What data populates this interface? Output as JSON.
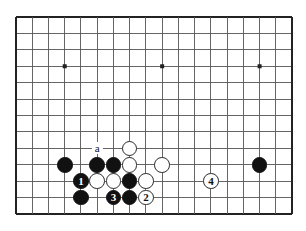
{
  "figure": {
    "kind": "go-board-diagram",
    "title": "",
    "board": {
      "columns": 18,
      "rows": 13,
      "left": 16,
      "top": 17,
      "cell_x": 16.24,
      "cell_y": 16.42,
      "line_color": "#555555",
      "edge_color": "#222222",
      "background_color": "#ffffff",
      "star_points": [
        {
          "col": 3,
          "row": 3
        },
        {
          "col": 9,
          "row": 3
        },
        {
          "col": 15,
          "row": 3
        }
      ]
    },
    "colors": {
      "black_stone": "#111111",
      "white_stone": "#ffffff",
      "white_stone_border": "#2a2a2a",
      "black_label_text": "#ffffff",
      "white_label_text": "#111111"
    },
    "stones": [
      {
        "id": "b-left-outer",
        "color": "black",
        "col": 3,
        "row": 9,
        "label": ""
      },
      {
        "id": "b-upper-left",
        "color": "black",
        "col": 5,
        "row": 9,
        "label": ""
      },
      {
        "id": "b-upper-mid",
        "color": "black",
        "col": 6,
        "row": 9,
        "label": ""
      },
      {
        "id": "w-top",
        "color": "white",
        "col": 7,
        "row": 8,
        "label": ""
      },
      {
        "id": "w-upper-mid",
        "color": "white",
        "col": 7,
        "row": 9,
        "label": ""
      },
      {
        "id": "w-right-wing",
        "color": "white",
        "col": 9,
        "row": 9,
        "label": ""
      },
      {
        "id": "b-move-1",
        "color": "black",
        "col": 4,
        "row": 10,
        "label": "1"
      },
      {
        "id": "w-mid-left",
        "color": "white",
        "col": 5,
        "row": 10,
        "label": ""
      },
      {
        "id": "w-mid-center",
        "color": "white",
        "col": 6,
        "row": 10,
        "label": ""
      },
      {
        "id": "b-mid-right",
        "color": "black",
        "col": 7,
        "row": 10,
        "label": ""
      },
      {
        "id": "w-mid-far",
        "color": "white",
        "col": 8,
        "row": 10,
        "label": ""
      },
      {
        "id": "b-low-left",
        "color": "black",
        "col": 4,
        "row": 11,
        "label": ""
      },
      {
        "id": "b-move-3",
        "color": "black",
        "col": 6,
        "row": 11,
        "label": "3"
      },
      {
        "id": "b-low-right",
        "color": "black",
        "col": 7,
        "row": 11,
        "label": ""
      },
      {
        "id": "w-move-2",
        "color": "white",
        "col": 8,
        "row": 11,
        "label": "2"
      },
      {
        "id": "w-move-4",
        "color": "white",
        "col": 12,
        "row": 10,
        "label": "4"
      },
      {
        "id": "b-far-right",
        "color": "black",
        "col": 15,
        "row": 9,
        "label": ""
      }
    ],
    "point_markers": [
      {
        "id": "point-a",
        "label": "a",
        "col": 5,
        "row": 8
      }
    ],
    "move_numbers": [
      "1",
      "2",
      "3",
      "4"
    ],
    "letter_markers": [
      "a"
    ]
  }
}
